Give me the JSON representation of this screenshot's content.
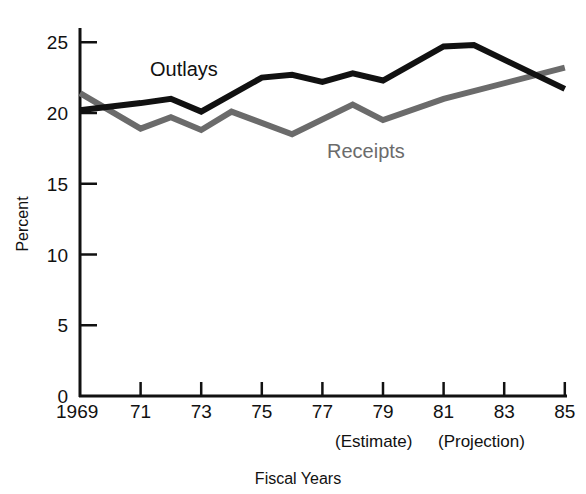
{
  "chart_data": {
    "type": "line",
    "title": "",
    "xlabel": "Fiscal Years",
    "ylabel": "Percent",
    "ylim": [
      0,
      25
    ],
    "xlim": [
      1969,
      1985
    ],
    "grid": false,
    "legend_position": "inline labels",
    "y_ticks": [
      0,
      5,
      10,
      15,
      20,
      25
    ],
    "x_ticks": [
      1969,
      1971,
      1973,
      1975,
      1977,
      1979,
      1981,
      1983,
      1985
    ],
    "x_tick_labels": [
      "1969",
      "71",
      "73",
      "75",
      "77",
      "79",
      "81",
      "83",
      "85"
    ],
    "annotations": [
      "(Estimate)",
      "(Projection)"
    ],
    "series": [
      {
        "name": "Outlays",
        "color": "#111111",
        "x": [
          1969,
          1969.4,
          1971,
          1972,
          1973,
          1975,
          1976,
          1977,
          1978,
          1979,
          1981,
          1982,
          1985
        ],
        "values": [
          20.2,
          20.3,
          20.7,
          21.0,
          20.1,
          22.5,
          22.7,
          22.2,
          22.8,
          22.3,
          24.7,
          24.8,
          21.7
        ]
      },
      {
        "name": "Receipts",
        "color": "#6b6b6b",
        "x": [
          1969,
          1971,
          1972,
          1973,
          1974,
          1976,
          1978,
          1979,
          1981,
          1985
        ],
        "values": [
          21.4,
          18.9,
          19.7,
          18.8,
          20.1,
          18.5,
          20.6,
          19.5,
          21.0,
          23.2
        ]
      }
    ]
  },
  "labels": {
    "outlays": "Outlays",
    "receipts": "Receipts",
    "estimate": "(Estimate)",
    "projection": "(Projection)",
    "x_title": "Fiscal Years",
    "y_title": "Percent"
  }
}
